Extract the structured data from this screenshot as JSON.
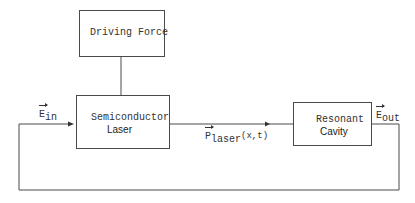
{
  "diagram": {
    "blocks": {
      "driving_force": {
        "label": "Driving Force"
      },
      "semiconductor_laser": {
        "line1": "Semiconductor",
        "line2": "Laser"
      },
      "resonant_cavity": {
        "line1": "Resonant",
        "line2": "Cavity"
      }
    },
    "signals": {
      "e_in": {
        "base": "E",
        "sub": "in"
      },
      "p_laser": {
        "base": "P",
        "sub": "laser",
        "args": "(x,t)"
      },
      "e_out": {
        "base": "E",
        "sub": "out"
      }
    },
    "colors": {
      "line": "#4a4a4a",
      "text": "#333333",
      "background": "#ffffff"
    }
  }
}
